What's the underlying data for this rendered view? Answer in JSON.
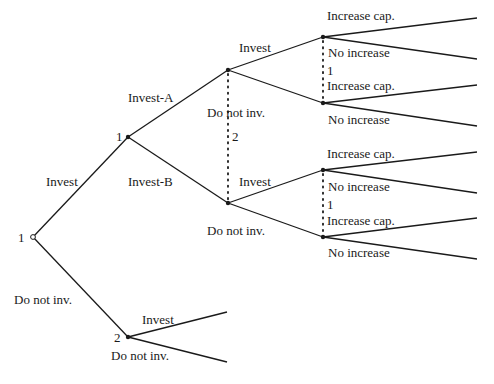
{
  "diagram": {
    "type": "game-tree",
    "colors": {
      "line": "#1a1a1a",
      "background": "#ffffff"
    },
    "nodes": [
      {
        "id": "root",
        "player": "1",
        "x": 33,
        "y": 237,
        "kind": "open"
      },
      {
        "id": "p1",
        "player": "1",
        "x": 128,
        "y": 137,
        "kind": "filled"
      },
      {
        "id": "p2",
        "player": "2",
        "x": 128,
        "y": 337,
        "kind": "filled"
      },
      {
        "id": "a",
        "x": 228,
        "y": 70,
        "kind": "filled"
      },
      {
        "id": "b",
        "x": 228,
        "y": 203,
        "kind": "filled"
      },
      {
        "id": "aa",
        "x": 323,
        "y": 37,
        "kind": "filled"
      },
      {
        "id": "ab",
        "x": 323,
        "y": 103,
        "kind": "filled"
      },
      {
        "id": "ba",
        "x": 323,
        "y": 170,
        "kind": "filled"
      },
      {
        "id": "bb",
        "x": 323,
        "y": 237,
        "kind": "filled"
      }
    ],
    "edges": [
      {
        "from": [
          33,
          237
        ],
        "to": [
          128,
          137
        ]
      },
      {
        "from": [
          33,
          237
        ],
        "to": [
          128,
          337
        ]
      },
      {
        "from": [
          128,
          137
        ],
        "to": [
          228,
          70
        ]
      },
      {
        "from": [
          128,
          137
        ],
        "to": [
          228,
          203
        ]
      },
      {
        "from": [
          228,
          70
        ],
        "to": [
          323,
          37
        ]
      },
      {
        "from": [
          228,
          70
        ],
        "to": [
          323,
          103
        ]
      },
      {
        "from": [
          228,
          203
        ],
        "to": [
          323,
          170
        ]
      },
      {
        "from": [
          228,
          203
        ],
        "to": [
          323,
          237
        ]
      },
      {
        "from": [
          323,
          37
        ],
        "to": [
          477,
          18
        ]
      },
      {
        "from": [
          323,
          37
        ],
        "to": [
          477,
          59
        ]
      },
      {
        "from": [
          323,
          103
        ],
        "to": [
          477,
          85
        ]
      },
      {
        "from": [
          323,
          103
        ],
        "to": [
          477,
          126
        ]
      },
      {
        "from": [
          323,
          170
        ],
        "to": [
          477,
          152
        ]
      },
      {
        "from": [
          323,
          170
        ],
        "to": [
          477,
          193
        ]
      },
      {
        "from": [
          323,
          237
        ],
        "to": [
          477,
          218
        ]
      },
      {
        "from": [
          323,
          237
        ],
        "to": [
          477,
          259
        ]
      },
      {
        "from": [
          128,
          337
        ],
        "to": [
          227,
          312
        ]
      },
      {
        "from": [
          128,
          337
        ],
        "to": [
          227,
          362
        ]
      }
    ],
    "information_sets": [
      {
        "from": [
          228,
          70
        ],
        "to": [
          228,
          203
        ],
        "player_label": "2"
      },
      {
        "from": [
          323,
          37
        ],
        "to": [
          323,
          103
        ],
        "player_label": "1"
      },
      {
        "from": [
          323,
          170
        ],
        "to": [
          323,
          237
        ],
        "player_label": "1"
      }
    ],
    "labels": {
      "root_player": "1",
      "p1_player": "1",
      "p2_player": "2",
      "infoset_a_player": "2",
      "infoset_upper_player": "1",
      "infoset_lower_player": "1",
      "root_invest": "Invest",
      "root_do_not": "Do not inv.",
      "invest_a": "Invest-A",
      "invest_b": "Invest-B",
      "a_invest": "Invest",
      "a_do_not": "Do not inv.",
      "b_invest": "Invest",
      "b_do_not": "Do not inv.",
      "aa_increase": "Increase cap.",
      "aa_no": "No increase",
      "ab_increase": "Increase cap.",
      "ab_no": "No increase",
      "ba_increase": "Increase cap.",
      "ba_no": "No increase",
      "bb_increase": "Increase cap.",
      "bb_no": "No increase",
      "p2_invest": "Invest",
      "p2_do_not": "Do not inv."
    }
  }
}
